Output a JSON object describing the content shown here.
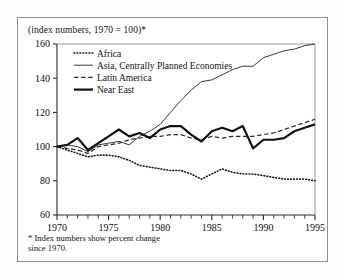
{
  "figure": {
    "caption_top": "(index numbers, 1970 = 100)*",
    "footnote_line1": "* Index numbers show percent change",
    "footnote_line2": "since 1970."
  },
  "chart_data": {
    "type": "line",
    "title": "(index numbers, 1970 = 100)*",
    "xlabel": "",
    "ylabel": "",
    "xlim": [
      1970,
      1995
    ],
    "ylim": [
      60,
      160
    ],
    "yticks": [
      60,
      80,
      100,
      120,
      140,
      160
    ],
    "xticks": [
      1970,
      1975,
      1980,
      1985,
      1990,
      1995
    ],
    "xtick_labels": [
      "1970",
      "1975",
      "1980",
      "1985",
      "1990",
      "1995"
    ],
    "ytick_labels": [
      "60",
      "80",
      "100",
      "120",
      "140",
      "160"
    ],
    "x_minor_ticks_every": 1,
    "grid": false,
    "legend_position": "upper-left-inside",
    "x": [
      1970,
      1971,
      1972,
      1973,
      1974,
      1975,
      1976,
      1977,
      1978,
      1979,
      1980,
      1981,
      1982,
      1983,
      1984,
      1985,
      1986,
      1987,
      1988,
      1989,
      1990,
      1991,
      1992,
      1993,
      1994,
      1995
    ],
    "series": [
      {
        "name": "Africa",
        "style": "dotted",
        "color": "#1a1a1a",
        "width": 1.6,
        "values": [
          100,
          98,
          96,
          94,
          95,
          95,
          94,
          92,
          89,
          88,
          87,
          86,
          86,
          84,
          81,
          84,
          87,
          85,
          84,
          84,
          83,
          82,
          81,
          81,
          81,
          80
        ]
      },
      {
        "name": "Asia, Centrally Planned Economies",
        "style": "solid-thin",
        "color": "#3a3a3a",
        "width": 1.0,
        "values": [
          100,
          101,
          100,
          97,
          101,
          102,
          103,
          101,
          106,
          109,
          113,
          120,
          127,
          133,
          138,
          139,
          142,
          145,
          147,
          147,
          152,
          154,
          156,
          157,
          159,
          160
        ]
      },
      {
        "name": "Latin America",
        "style": "dashed",
        "color": "#2a2a2a",
        "width": 1.2,
        "values": [
          100,
          99,
          98,
          96,
          100,
          101,
          102,
          104,
          105,
          106,
          106,
          107,
          107,
          105,
          104,
          106,
          105,
          106,
          106,
          106,
          107,
          108,
          110,
          112,
          114,
          116
        ]
      },
      {
        "name": "Near East",
        "style": "solid-thick",
        "color": "#111111",
        "width": 2.2,
        "values": [
          100,
          101,
          105,
          98,
          102,
          106,
          110,
          106,
          108,
          105,
          110,
          112,
          112,
          107,
          103,
          109,
          111,
          109,
          112,
          99,
          104,
          104,
          105,
          109,
          111,
          113
        ]
      }
    ]
  },
  "legend": {
    "items": [
      {
        "label": "Africa",
        "swatch": "dotted"
      },
      {
        "label": "Asia, Centrally Planned Economies",
        "swatch": "solid-thin"
      },
      {
        "label": "Latin America",
        "swatch": "dashed"
      },
      {
        "label": "Near East",
        "swatch": "solid-thick"
      }
    ]
  }
}
